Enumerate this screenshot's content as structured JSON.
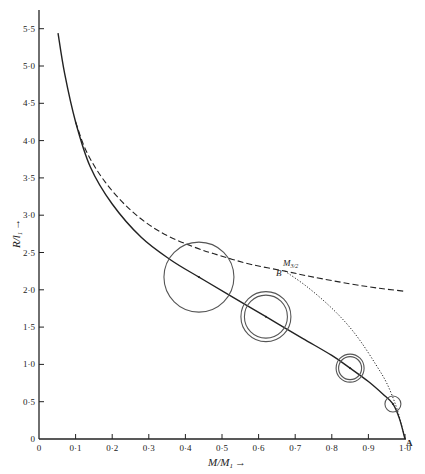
{
  "chart_data": {
    "type": "line",
    "title": "",
    "xlabel": "M/M₁ →",
    "ylabel": "R/l₁ →",
    "xlim": [
      0,
      1.0
    ],
    "ylim": [
      0,
      5.75
    ],
    "grid": false,
    "x_ticks": [
      "0",
      "0·1",
      "0·2",
      "0·3",
      "0·4",
      "0·5",
      "0·6",
      "0·7",
      "0·8",
      "0·9",
      "1·0"
    ],
    "y_ticks": [
      "0",
      "0·5",
      "1·0",
      "1·5",
      "2·0",
      "2·5",
      "3·0",
      "3·5",
      "4·0",
      "4·5",
      "5·0",
      "5·5"
    ],
    "series": [
      {
        "name": "solid-curve",
        "style": "solid",
        "points": [
          [
            0.052,
            5.44
          ],
          [
            0.07,
            4.9
          ],
          [
            0.1,
            4.25
          ],
          [
            0.14,
            3.65
          ],
          [
            0.2,
            3.15
          ],
          [
            0.28,
            2.7
          ],
          [
            0.36,
            2.4
          ],
          [
            0.437,
            2.17
          ],
          [
            0.52,
            1.93
          ],
          [
            0.62,
            1.64
          ],
          [
            0.72,
            1.35
          ],
          [
            0.8,
            1.12
          ],
          [
            0.85,
            0.95
          ],
          [
            0.9,
            0.77
          ],
          [
            0.94,
            0.6
          ],
          [
            0.967,
            0.47
          ],
          [
            0.985,
            0.27
          ],
          [
            1.0,
            0.0
          ]
        ]
      },
      {
        "name": "dashed-curve",
        "style": "dashed",
        "points": [
          [
            0.1,
            4.25
          ],
          [
            0.13,
            3.85
          ],
          [
            0.18,
            3.45
          ],
          [
            0.25,
            3.07
          ],
          [
            0.33,
            2.78
          ],
          [
            0.42,
            2.58
          ],
          [
            0.5,
            2.45
          ],
          [
            0.58,
            2.34
          ],
          [
            0.672,
            2.25
          ],
          [
            0.75,
            2.17
          ],
          [
            0.85,
            2.08
          ],
          [
            0.93,
            2.02
          ],
          [
            1.0,
            1.98
          ]
        ]
      },
      {
        "name": "dotted-curve",
        "style": "dotted",
        "points": [
          [
            0.672,
            2.25
          ],
          [
            0.73,
            2.05
          ],
          [
            0.79,
            1.8
          ],
          [
            0.84,
            1.55
          ],
          [
            0.88,
            1.3
          ],
          [
            0.92,
            1.0
          ],
          [
            0.95,
            0.75
          ],
          [
            0.975,
            0.45
          ],
          [
            0.99,
            0.2
          ],
          [
            1.0,
            0.0
          ]
        ]
      }
    ],
    "circles": [
      {
        "cx": 0.437,
        "cy": 2.17,
        "r_px": 35,
        "double": false
      },
      {
        "cx": 0.62,
        "cy": 1.64,
        "r_px": 25,
        "double": true,
        "r_inner_px": 21.5
      },
      {
        "cx": 0.85,
        "cy": 0.95,
        "r_px": 14,
        "double": true,
        "r_inner_px": 11.5
      },
      {
        "cx": 0.967,
        "cy": 0.47,
        "r_px": 8,
        "double": false
      }
    ],
    "annotations": [
      {
        "text": "M",
        "sub": "3/2",
        "x": 0.672,
        "y": 2.25
      },
      {
        "text": "B",
        "x": 0.672,
        "y": 2.25
      },
      {
        "text": "A",
        "x": 1.0,
        "y": 0.0
      }
    ]
  },
  "labels": {
    "xlabel_main": "M/M",
    "xlabel_sub": "1",
    "xlabel_arrow": "→",
    "ylabel_main": "R/l",
    "ylabel_sub": "1",
    "ylabel_arrow": "→",
    "point_m": "M",
    "point_m_sub": "3/2",
    "point_b": "B",
    "point_a": "A"
  }
}
